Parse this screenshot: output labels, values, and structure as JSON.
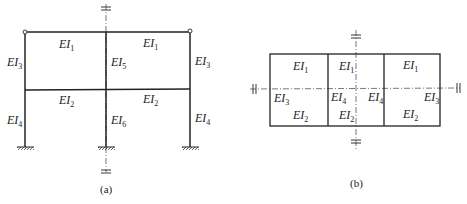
{
  "figure_a": {
    "caption": "(a)",
    "labels": {
      "top_beam_left": {
        "base": "EI",
        "sub": "1"
      },
      "top_beam_right": {
        "base": "EI",
        "sub": "1"
      },
      "upper_col_left": {
        "base": "EI",
        "sub": "3"
      },
      "upper_col_mid": {
        "base": "EI",
        "sub": "5"
      },
      "upper_col_right": {
        "base": "EI",
        "sub": "3"
      },
      "mid_beam_left": {
        "base": "EI",
        "sub": "2"
      },
      "mid_beam_right": {
        "base": "EI",
        "sub": "2"
      },
      "lower_col_left": {
        "base": "EI",
        "sub": "4"
      },
      "lower_col_mid": {
        "base": "EI",
        "sub": "6"
      },
      "lower_col_right": {
        "base": "EI",
        "sub": "4"
      }
    }
  },
  "figure_b": {
    "caption": "(b)",
    "labels": {
      "top_left": {
        "base": "EI",
        "sub": "1"
      },
      "top_mid": {
        "base": "EI",
        "sub": "1"
      },
      "top_right": {
        "base": "EI",
        "sub": "1"
      },
      "left_side": {
        "base": "EI",
        "sub": "3"
      },
      "inner_left": {
        "base": "EI",
        "sub": "4"
      },
      "inner_right": {
        "base": "EI",
        "sub": "4"
      },
      "right_side": {
        "base": "EI",
        "sub": "3"
      },
      "bottom_left": {
        "base": "EI",
        "sub": "2"
      },
      "bottom_mid": {
        "base": "EI",
        "sub": "2"
      },
      "bottom_right": {
        "base": "EI",
        "sub": "2"
      }
    }
  },
  "colors": {
    "line": "#222222",
    "axis": "#555555"
  }
}
